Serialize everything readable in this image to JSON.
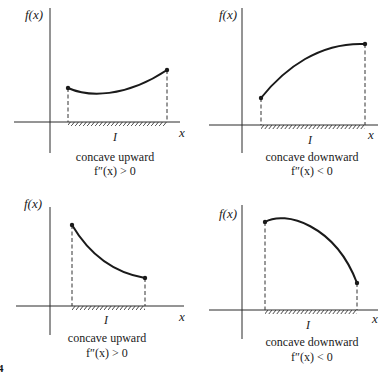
{
  "figure": {
    "figure_number_fragment": "4",
    "panels": [
      {
        "id": "top-left",
        "y_axis_label": "f(x)",
        "x_axis_label": "x",
        "interval_label": "I",
        "caption_line1": "concave upward",
        "caption_line2": "f″(x) > 0",
        "curve_shape": "concave up, dips then rises"
      },
      {
        "id": "top-right",
        "y_axis_label": "f(x)",
        "x_axis_label": "x",
        "interval_label": "I",
        "caption_line1": "concave downward",
        "caption_line2": "f″(x) < 0",
        "curve_shape": "concave down, increasing"
      },
      {
        "id": "bottom-left",
        "y_axis_label": "f(x)",
        "x_axis_label": "x",
        "interval_label": "I",
        "caption_line1": "concave upward",
        "caption_line2": "f″(x) > 0",
        "curve_shape": "concave up, decreasing"
      },
      {
        "id": "bottom-right",
        "y_axis_label": "f(x)",
        "x_axis_label": "x",
        "interval_label": "I",
        "caption_line1": "concave downward",
        "caption_line2": "f″(x) < 0",
        "curve_shape": "concave down, rises slightly then falls"
      }
    ]
  }
}
